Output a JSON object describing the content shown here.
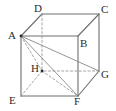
{
  "figure": {
    "name": "cube-diagram",
    "width": 116,
    "height": 111,
    "background_color": "#ffffff",
    "solid_edge_color": "#6e6e6e",
    "hidden_edge_color": "#9a9a9a",
    "diagonal_color": "#7a7a7a",
    "label_color": "#2b2b2b",
    "solid_edge_width": 1.1,
    "hidden_edge_width": 0.9,
    "diagonal_width": 0.8,
    "dash_pattern": "2.2,2.2"
  },
  "vertices": [
    {
      "id": "A",
      "label": "A",
      "x": 21,
      "y": 36,
      "label_x": 8,
      "label_y": 30,
      "hidden": false,
      "dot": true
    },
    {
      "id": "B",
      "label": "B",
      "x": 78,
      "y": 36,
      "label_x": 80,
      "label_y": 38,
      "hidden": false,
      "dot": false
    },
    {
      "id": "C",
      "label": "C",
      "x": 99,
      "y": 14,
      "label_x": 101,
      "label_y": 4,
      "hidden": false,
      "dot": false
    },
    {
      "id": "D",
      "label": "D",
      "x": 42,
      "y": 14,
      "label_x": 34,
      "label_y": 3,
      "hidden": false,
      "dot": false
    },
    {
      "id": "E",
      "label": "E",
      "x": 21,
      "y": 96,
      "label_x": 9,
      "label_y": 95,
      "hidden": false,
      "dot": false
    },
    {
      "id": "F",
      "label": "F",
      "x": 78,
      "y": 96,
      "label_x": 74,
      "label_y": 96,
      "hidden": false,
      "dot": false
    },
    {
      "id": "G",
      "label": "G",
      "x": 99,
      "y": 71,
      "label_x": 101,
      "label_y": 69,
      "hidden": true,
      "dot": false
    },
    {
      "id": "H",
      "label": "H",
      "x": 42,
      "y": 71,
      "label_x": 31,
      "label_y": 63,
      "hidden": true,
      "dot": true
    }
  ],
  "edges": [
    {
      "from": "A",
      "to": "B",
      "kind": "solid",
      "name": "edge-AB"
    },
    {
      "from": "B",
      "to": "C",
      "kind": "solid",
      "name": "edge-BC"
    },
    {
      "from": "C",
      "to": "D",
      "kind": "solid",
      "name": "edge-CD"
    },
    {
      "from": "D",
      "to": "A",
      "kind": "solid",
      "name": "edge-DA"
    },
    {
      "from": "A",
      "to": "E",
      "kind": "solid",
      "name": "edge-AE"
    },
    {
      "from": "B",
      "to": "F",
      "kind": "solid",
      "name": "edge-BF"
    },
    {
      "from": "C",
      "to": "G",
      "kind": "solid",
      "name": "edge-CG"
    },
    {
      "from": "D",
      "to": "H",
      "kind": "dashed",
      "name": "edge-DH"
    },
    {
      "from": "E",
      "to": "F",
      "kind": "solid",
      "name": "edge-EF"
    },
    {
      "from": "F",
      "to": "G",
      "kind": "solid",
      "name": "edge-FG"
    },
    {
      "from": "G",
      "to": "H",
      "kind": "dashed",
      "name": "edge-GH"
    },
    {
      "from": "H",
      "to": "E",
      "kind": "dashed",
      "name": "edge-HE"
    }
  ],
  "diagonals": [
    {
      "from": "A",
      "to": "H",
      "kind": "dashed",
      "name": "diagonal-AH"
    },
    {
      "from": "A",
      "to": "F",
      "kind": "solid",
      "name": "diagonal-AF"
    },
    {
      "from": "A",
      "to": "G",
      "kind": "solid",
      "name": "diagonal-AG"
    },
    {
      "from": "H",
      "to": "F",
      "kind": "dashed",
      "name": "diagonal-HF"
    }
  ]
}
